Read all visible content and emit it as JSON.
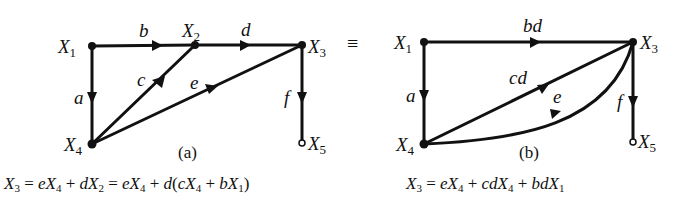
{
  "diagram_a": {
    "caption": "(a)",
    "nodes": [
      {
        "id": "X1",
        "var": "X",
        "sub": "1"
      },
      {
        "id": "X2",
        "var": "X",
        "sub": "2"
      },
      {
        "id": "X3",
        "var": "X",
        "sub": "3"
      },
      {
        "id": "X4",
        "var": "X",
        "sub": "4"
      },
      {
        "id": "X5",
        "var": "X",
        "sub": "5"
      }
    ],
    "edges": [
      {
        "from": "X1",
        "to": "X2",
        "gain": "b"
      },
      {
        "from": "X2",
        "to": "X3",
        "gain": "d"
      },
      {
        "from": "X1",
        "to": "X4",
        "gain": "a"
      },
      {
        "from": "X4",
        "to": "X2",
        "gain": "c"
      },
      {
        "from": "X4",
        "to": "X3",
        "gain": "e"
      },
      {
        "from": "X3",
        "to": "X5",
        "gain": "f"
      }
    ],
    "equation": {
      "lhs": "X3",
      "text": "X3 = eX4 + dX2 = eX4 + d(cX4 + bX1)"
    }
  },
  "equivalence_symbol": "≡",
  "diagram_b": {
    "caption": "(b)",
    "nodes": [
      {
        "id": "X1",
        "var": "X",
        "sub": "1"
      },
      {
        "id": "X3",
        "var": "X",
        "sub": "3"
      },
      {
        "id": "X4",
        "var": "X",
        "sub": "4"
      },
      {
        "id": "X5",
        "var": "X",
        "sub": "5"
      }
    ],
    "edges": [
      {
        "from": "X1",
        "to": "X3",
        "gain": "bd"
      },
      {
        "from": "X1",
        "to": "X4",
        "gain": "a"
      },
      {
        "from": "X4",
        "to": "X3",
        "gain": "cd"
      },
      {
        "from": "X4",
        "to": "X3",
        "gain": "e"
      },
      {
        "from": "X3",
        "to": "X5",
        "gain": "f"
      }
    ],
    "equation": {
      "lhs": "X3",
      "text": "X3 = eX4 + cdX4 + bdX1"
    }
  }
}
